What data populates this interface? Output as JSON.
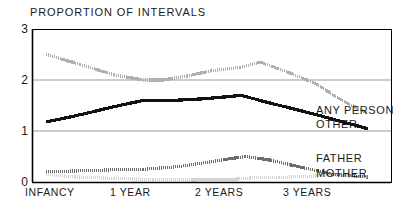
{
  "chart_data": {
    "type": "line",
    "title": "PROPORTION OF INTERVALS",
    "xlabel": "",
    "ylabel": "",
    "ylim": [
      0,
      3
    ],
    "yticks": [
      "0",
      "1",
      "2",
      "3"
    ],
    "ytick_values": [
      0,
      1,
      2,
      3
    ],
    "categories": [
      "INFANCY",
      "1 YEAR",
      "2 YEARS",
      "3 YEARS"
    ],
    "category_positions": [
      0,
      1,
      2,
      3
    ],
    "xlim": [
      -0.15,
      3.55
    ],
    "grid": "horizontal gridlines at y = 1 and y = 2",
    "legend_position": "right-inline labels at end of each line",
    "series": [
      {
        "name": "ANY PERSON",
        "color": "#b0b0b0",
        "style": "stippled-thick",
        "x": [
          0,
          0.35,
          0.7,
          1.0,
          1.2,
          1.45,
          1.7,
          2.0,
          2.2,
          2.45,
          2.75,
          3.05,
          3.3
        ],
        "values": [
          2.5,
          2.3,
          2.1,
          2.0,
          2.0,
          2.08,
          2.18,
          2.25,
          2.35,
          2.18,
          1.95,
          1.6,
          1.35
        ]
      },
      {
        "name": "OTHER",
        "color": "#111111",
        "style": "stippled-thick",
        "x": [
          0,
          0.35,
          0.7,
          1.0,
          1.3,
          1.6,
          1.85,
          2.0,
          2.3,
          2.7,
          3.05,
          3.3
        ],
        "values": [
          1.18,
          1.32,
          1.48,
          1.6,
          1.6,
          1.63,
          1.67,
          1.7,
          1.55,
          1.36,
          1.18,
          1.05
        ]
      },
      {
        "name": "FATHER",
        "color": "#6e6e6e",
        "style": "stippled-thick",
        "x": [
          0,
          0.35,
          0.7,
          1.0,
          1.35,
          1.7,
          1.9,
          2.05,
          2.3,
          2.6,
          2.95,
          3.3
        ],
        "values": [
          0.2,
          0.22,
          0.24,
          0.25,
          0.3,
          0.4,
          0.46,
          0.5,
          0.43,
          0.3,
          0.15,
          0.1
        ]
      },
      {
        "name": "MOTHER",
        "color": "#d4d4d4",
        "style": "stippled-thick",
        "x": [
          0,
          0.3,
          0.7,
          1.1,
          1.5,
          1.9,
          2.1,
          2.4,
          2.8,
          3.1,
          3.3
        ],
        "values": [
          0.15,
          0.1,
          0.07,
          0.05,
          0.04,
          0.05,
          0.08,
          0.09,
          0.12,
          0.12,
          0.1
        ]
      }
    ]
  },
  "series_labels": [
    {
      "text": "ANY PERSON",
      "left": 316,
      "top": 104
    },
    {
      "text": "OTHER",
      "left": 316,
      "top": 118
    },
    {
      "text": "FATHER",
      "left": 316,
      "top": 152
    },
    {
      "text": "MOTHER",
      "left": 316,
      "top": 167
    }
  ],
  "ytick_labels": [
    {
      "text": "3",
      "top": 22
    },
    {
      "text": "2",
      "top": 73
    },
    {
      "text": "1",
      "top": 124
    },
    {
      "text": "0",
      "top": 175
    }
  ],
  "xtick_labels": [
    {
      "text": "INFANCY",
      "left": 25
    },
    {
      "text": "1 YEAR",
      "left": 110
    },
    {
      "text": "2 YEARS",
      "left": 195
    },
    {
      "text": "3 YEARS",
      "left": 283
    }
  ],
  "colors": {
    "frame": "#000000",
    "gridline": "#9a9a9a",
    "text": "#1a1a1a",
    "any_person": "#b0b0b0",
    "other": "#111111",
    "father": "#6e6e6e",
    "mother": "#d4d4d4"
  }
}
